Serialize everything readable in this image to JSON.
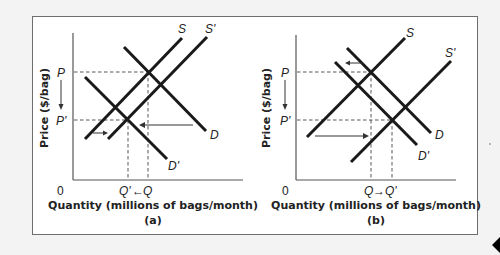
{
  "figure": {
    "panels": [
      {
        "id": "a",
        "caption": "(a)",
        "x_axis_label": "Quantity (millions of bags/month)",
        "y_axis_label": "Price ($/bag)",
        "origin_label": "0",
        "price_labels": {
          "initial": "P",
          "new": "P'"
        },
        "quantity_labels": {
          "new": "Q'",
          "initial": "Q",
          "arrow": "←"
        },
        "curve_labels": {
          "supply": "S",
          "supply_shifted": "S'",
          "demand": "D",
          "demand_shifted": "D'"
        },
        "description": "Supply shifts right slightly, demand shifts left a lot; price falls P→P', quantity falls Q→Q'"
      },
      {
        "id": "b",
        "caption": "(b)",
        "x_axis_label": "Quantity (millions of bags/month)",
        "y_axis_label": "Price ($/bag)",
        "origin_label": "0",
        "price_labels": {
          "initial": "P",
          "new": "P'"
        },
        "quantity_labels": {
          "initial": "Q",
          "new": "Q'",
          "arrow": "→"
        },
        "curve_labels": {
          "supply": "S",
          "supply_shifted": "S'",
          "demand": "D",
          "demand_shifted": "D'"
        },
        "description": "Demand shifts left slightly, supply shifts right a lot; price falls P→P', quantity rises Q→Q'"
      }
    ]
  },
  "colors": {
    "line": "#1a1a1a",
    "frame": "#6e6e6e",
    "background": "#f3f3f3"
  }
}
